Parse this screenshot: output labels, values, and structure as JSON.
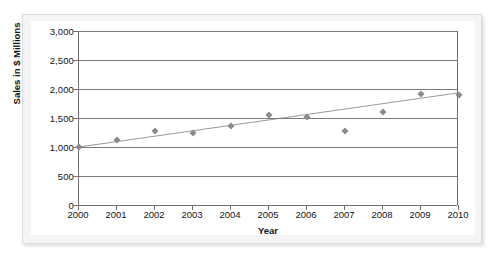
{
  "chart_data": {
    "type": "scatter",
    "title": "",
    "xlabel": "Year",
    "ylabel": "Sales in $ Millions",
    "x": [
      2000,
      2001,
      2002,
      2003,
      2004,
      2005,
      2006,
      2007,
      2008,
      2009,
      2010
    ],
    "values": [
      1000,
      1120,
      1280,
      1240,
      1360,
      1550,
      1510,
      1270,
      1610,
      1920,
      1900
    ],
    "categories": [
      "2000",
      "2001",
      "2002",
      "2003",
      "2004",
      "2005",
      "2006",
      "2007",
      "2008",
      "2009",
      "2010"
    ],
    "xtick_labels": [
      "2000",
      "2001",
      "2002",
      "2003",
      "2004",
      "2005",
      "2006",
      "2007",
      "2008",
      "2009",
      "2010"
    ],
    "ytick_labels": [
      "0",
      "500",
      "1,000",
      "1,500",
      "2,000",
      "2,500",
      "3,000"
    ],
    "ytick_values": [
      0,
      500,
      1000,
      1500,
      2000,
      2500,
      3000
    ],
    "ylim": [
      0,
      3000
    ],
    "xlim": [
      2000,
      2010
    ],
    "grid": true,
    "legend": false,
    "series": [
      {
        "name": "Sales",
        "marker": "diamond",
        "color": "#8a8a8a",
        "values": [
          1000,
          1120,
          1280,
          1240,
          1360,
          1550,
          1510,
          1270,
          1610,
          1920,
          1900
        ]
      },
      {
        "name": "Linear trendline",
        "type": "line",
        "color": "#9a9a9a",
        "endpoints": [
          {
            "x": 2000,
            "y": 1000
          },
          {
            "x": 2010,
            "y": 1930
          }
        ]
      }
    ],
    "colors": {
      "marker": "#8a8a8a",
      "trendline": "#9a9a9a",
      "axis": "#6f6f6f",
      "gridline": "#7a7a7a",
      "text": "#141414",
      "plot_background": "#ffffff",
      "panel_background": "#f4f4f4"
    }
  }
}
